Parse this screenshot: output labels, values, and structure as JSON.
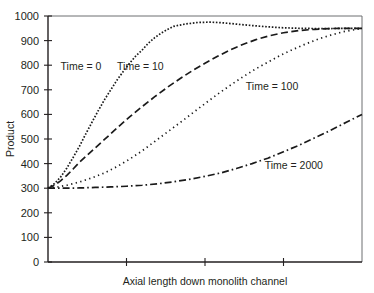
{
  "chart_data": {
    "type": "line",
    "title": "",
    "xlabel": "Axial length down monolith channel",
    "ylabel": "Product",
    "xlim": [
      0,
      1
    ],
    "ylim": [
      0,
      1000
    ],
    "grid": false,
    "legend_position": "inline-annotations",
    "y_ticks": [
      0,
      100,
      200,
      300,
      400,
      500,
      600,
      700,
      800,
      900,
      1000
    ],
    "y_tick_labels": [
      "0",
      "100",
      "200",
      "300",
      "400",
      "500",
      "600",
      "700",
      "800",
      "900",
      "1000"
    ],
    "x_ticks": [
      0,
      0.25,
      0.5,
      0.75,
      1
    ],
    "x_tick_labels": [
      "",
      "",
      "",
      "",
      ""
    ],
    "x_normalized_note": "Axial position expressed as fraction of channel length (0 to 1); axis ticks unlabeled",
    "series": [
      {
        "name": "Time = 0",
        "line_style": "dotted",
        "label_x": 0.04,
        "label_y": 780,
        "x": [
          0.0,
          0.02,
          0.04,
          0.06,
          0.08,
          0.1,
          0.12,
          0.14,
          0.16,
          0.18,
          0.2,
          0.22,
          0.24,
          0.26,
          0.28,
          0.3,
          0.32,
          0.34,
          0.36,
          0.38,
          0.4,
          0.44,
          0.48,
          0.52,
          0.56,
          0.6,
          0.65,
          0.7,
          0.75,
          0.8,
          0.85,
          0.9,
          0.95,
          1.0
        ],
        "y": [
          300,
          318,
          345,
          382,
          425,
          470,
          520,
          568,
          615,
          660,
          700,
          740,
          775,
          808,
          838,
          862,
          890,
          912,
          930,
          945,
          958,
          968,
          974,
          975,
          972,
          967,
          961,
          956,
          952,
          950,
          949,
          949,
          950,
          950
        ]
      },
      {
        "name": "Time = 10",
        "line_style": "dashed",
        "label_x": 0.22,
        "label_y": 780,
        "x": [
          0.0,
          0.02,
          0.04,
          0.06,
          0.08,
          0.1,
          0.14,
          0.18,
          0.22,
          0.26,
          0.3,
          0.34,
          0.38,
          0.42,
          0.46,
          0.5,
          0.54,
          0.58,
          0.62,
          0.66,
          0.7,
          0.75,
          0.8,
          0.85,
          0.9,
          0.95,
          1.0
        ],
        "y": [
          300,
          312,
          330,
          352,
          378,
          405,
          452,
          498,
          545,
          590,
          632,
          672,
          710,
          745,
          778,
          808,
          836,
          862,
          884,
          903,
          918,
          932,
          941,
          946,
          949,
          950,
          950
        ]
      },
      {
        "name": "Time = 100",
        "line_style": "fine-dotted",
        "label_x": 0.63,
        "label_y": 700,
        "x": [
          0.0,
          0.03,
          0.06,
          0.1,
          0.14,
          0.18,
          0.22,
          0.26,
          0.3,
          0.34,
          0.38,
          0.42,
          0.46,
          0.5,
          0.54,
          0.58,
          0.62,
          0.66,
          0.7,
          0.74,
          0.78,
          0.82,
          0.86,
          0.9,
          0.94,
          1.0
        ],
        "y": [
          300,
          305,
          312,
          325,
          342,
          362,
          388,
          418,
          452,
          490,
          528,
          566,
          605,
          644,
          682,
          718,
          752,
          784,
          812,
          840,
          864,
          886,
          906,
          922,
          936,
          950
        ]
      },
      {
        "name": "Time = 2000",
        "line_style": "dash-dot",
        "label_x": 0.69,
        "label_y": 380,
        "x": [
          0.0,
          0.05,
          0.1,
          0.15,
          0.2,
          0.25,
          0.3,
          0.35,
          0.4,
          0.45,
          0.5,
          0.55,
          0.6,
          0.65,
          0.7,
          0.75,
          0.8,
          0.85,
          0.9,
          0.95,
          1.0
        ],
        "y": [
          300,
          300,
          301,
          303,
          305,
          308,
          312,
          318,
          326,
          336,
          348,
          362,
          380,
          400,
          422,
          448,
          475,
          505,
          535,
          568,
          600
        ]
      }
    ]
  }
}
